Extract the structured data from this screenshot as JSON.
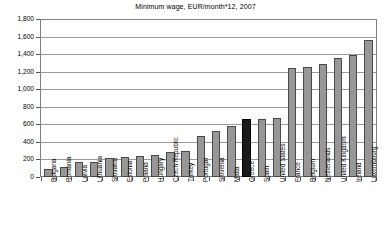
{
  "chart_data": {
    "type": "bar",
    "title": "Minimum wage, EUR/month*12, 2007",
    "xlabel": "",
    "ylabel": "",
    "ylim": [
      0,
      1800
    ],
    "ytick_step": 200,
    "grid": true,
    "legend": "none",
    "categories": [
      "Bulgaria",
      "Romania",
      "Latvia",
      "Lithuania",
      "Slovakia",
      "Estonia",
      "Poland",
      "Hungary",
      "Czech Republic",
      "Turkey",
      "Portugal",
      "Slovenia",
      "Malta",
      "Greece",
      "Spain",
      "United States",
      "France",
      "Belgium",
      "Netherlands",
      "United Kingdom",
      "Ireland",
      "Luxembourg"
    ],
    "values": [
      92,
      114,
      172,
      174,
      217,
      230,
      246,
      258,
      288,
      298,
      470,
      522,
      585,
      668,
      666,
      676,
      1254,
      1259,
      1301,
      1361,
      1403,
      1570
    ],
    "ytick_labels": [
      "0",
      "200",
      "400",
      "600",
      "800",
      "1,000",
      "1,200",
      "1,400",
      "1,600",
      "1,800"
    ],
    "ytick_values": [
      0,
      200,
      400,
      600,
      800,
      1000,
      1200,
      1400,
      1600,
      1800
    ],
    "highlight_category": "Greece",
    "colors": {
      "bar_fill": "#979797",
      "bar_border": "#4a4a4a",
      "highlight_fill": "#1a1a1a",
      "highlight_border": "#000000",
      "gridline": "#9a9a9a",
      "axis": "#7f7f7f",
      "text": "#000000",
      "background": "#ffffff"
    }
  }
}
